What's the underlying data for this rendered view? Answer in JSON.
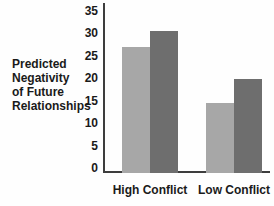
{
  "figure": {
    "ylabel_lines": [
      "Predicted",
      "Negativity",
      "of Future",
      "Relationships"
    ]
  },
  "chart_data": {
    "type": "bar",
    "title": "",
    "ylabel": "Predicted Negativity of Future Relationships",
    "xlabel": "",
    "categories": [
      "High Conflict",
      "Low Conflict"
    ],
    "series": [
      {
        "name": "light-gray-bar",
        "color": "#a7a7a7",
        "values": [
          27.5,
          15
        ]
      },
      {
        "name": "dark-gray-bar",
        "color": "#6e6e6e",
        "values": [
          31,
          20.5
        ]
      }
    ],
    "yticks": [
      0,
      5,
      10,
      15,
      20,
      25,
      30,
      35
    ],
    "ylim": [
      0,
      35
    ],
    "grid": false,
    "legend": "none",
    "axis_color": "#3d3d3d"
  }
}
